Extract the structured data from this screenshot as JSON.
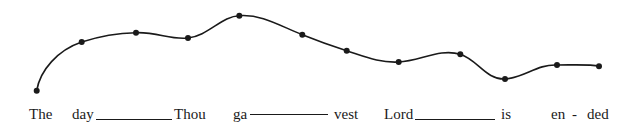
{
  "figure": {
    "type": "pitch-contour-diagram",
    "line_color": "#1a1a1a",
    "background": "#ffffff"
  },
  "contour_points": [
    {
      "x": 36.7,
      "y": 90.7
    },
    {
      "x": 81.7,
      "y": 42
    },
    {
      "x": 136,
      "y": 32.7
    },
    {
      "x": 188,
      "y": 38
    },
    {
      "x": 239.3,
      "y": 15.7
    },
    {
      "x": 302.3,
      "y": 34.7
    },
    {
      "x": 346.7,
      "y": 50.7
    },
    {
      "x": 398.7,
      "y": 62
    },
    {
      "x": 460.3,
      "y": 54.3
    },
    {
      "x": 505,
      "y": 79
    },
    {
      "x": 557,
      "y": 65
    },
    {
      "x": 599,
      "y": 66.3
    }
  ],
  "lyrics": {
    "syllables": [
      "The",
      "day",
      "Thou",
      "ga",
      "vest",
      "Lord",
      "is",
      "en",
      "-",
      "ded"
    ],
    "extenders": [
      "day-extender",
      "ga-hyphen-line",
      "Lord-extender"
    ]
  }
}
